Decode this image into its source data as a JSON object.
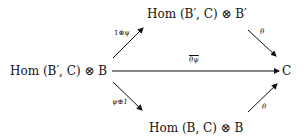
{
  "diagram": {
    "type": "commutative-diagram",
    "nodes": {
      "left": "Hom (B′, C) ⊗ B",
      "top": "Hom (B′, C) ⊗ B′",
      "right": "C",
      "bottom": "Hom (B, C) ⊗ B"
    },
    "arrows": {
      "left_to_top": "1⊗ψ",
      "top_to_right": "θ",
      "left_to_right": "θψ",
      "left_to_bottom": "ψ⊕1",
      "bottom_to_right": "θ"
    },
    "colors": {
      "ink": "#111111",
      "background": "#ffffff"
    }
  }
}
